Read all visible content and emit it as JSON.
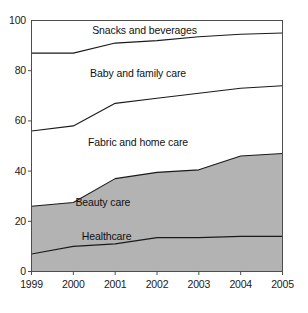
{
  "chart_data": {
    "type": "area",
    "title": "",
    "subtitle": "",
    "xlabel": "",
    "ylabel": "",
    "stacked": true,
    "grid": false,
    "legend_position": "inline-labels",
    "categories": [
      "1999",
      "2000",
      "2001",
      "2002",
      "2003",
      "2004",
      "2005"
    ],
    "x": [
      1999,
      2000,
      2001,
      2002,
      2003,
      2004,
      2005
    ],
    "xlim": [
      1999,
      2005
    ],
    "ylim": [
      0,
      100
    ],
    "yticks": [
      0,
      20,
      40,
      60,
      80,
      100
    ],
    "ytick_labels": [
      "0",
      "20",
      "40",
      "60",
      "80",
      "100"
    ],
    "xticks": [
      1999,
      2000,
      2001,
      2002,
      2003,
      2004,
      2005
    ],
    "series": [
      {
        "name": "Healthcare",
        "values": [
          7,
          10,
          11,
          13.5,
          13.5,
          14,
          14
        ],
        "cumulative": [
          7,
          10,
          11,
          13.5,
          13.5,
          14,
          14
        ],
        "fill": "#b3b3b3",
        "filled": true
      },
      {
        "name": "Beauty care",
        "values": [
          19,
          17.5,
          26,
          26,
          27,
          32,
          33
        ],
        "cumulative": [
          26,
          27.5,
          37,
          39.5,
          40.5,
          46,
          47
        ],
        "fill": "#b3b3b3",
        "filled": true
      },
      {
        "name": "Fabric and home care",
        "values": [
          30,
          30.5,
          30,
          29.5,
          30.5,
          27,
          27
        ],
        "cumulative": [
          56,
          58,
          67,
          69,
          71,
          73,
          74
        ],
        "fill": "#ffffff",
        "filled": false
      },
      {
        "name": "Baby and family care",
        "values": [
          31,
          29,
          24,
          23,
          22.5,
          21.5,
          21
        ],
        "cumulative": [
          87,
          87,
          91,
          92,
          93.5,
          94.5,
          95
        ],
        "fill": "#ffffff",
        "filled": false
      },
      {
        "name": "Snacks and beverages",
        "values": [
          13,
          13,
          9,
          8,
          6.5,
          5.5,
          5
        ],
        "cumulative": [
          100,
          100,
          100,
          100,
          100,
          100,
          100
        ],
        "fill": "#ffffff",
        "filled": false
      }
    ],
    "series_labels": [
      {
        "text": "Snacks and beverages",
        "x": 2000.45,
        "y": 96.2
      },
      {
        "text": "Baby and family care",
        "x": 2000.4,
        "y": 79.0
      },
      {
        "text": "Fabric and home care",
        "x": 2000.35,
        "y": 51.5
      },
      {
        "text": "Beauty care",
        "x": 2000.05,
        "y": 27.5
      },
      {
        "text": "Healthcare",
        "x": 2000.2,
        "y": 13.8
      }
    ],
    "colors": {
      "fill_gray": "#b3b3b3",
      "fill_white": "#ffffff",
      "line": "#1a1a1a",
      "axis": "#4d4d4d",
      "text": "#1a1a1a",
      "background": "#ffffff"
    }
  }
}
